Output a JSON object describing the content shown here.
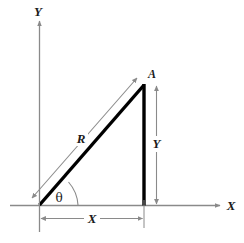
{
  "figure": {
    "kind": "vector-resolution-diagram",
    "background_color": "#ffffff",
    "width": 244,
    "height": 243,
    "axis_color": "#8a8a8a",
    "vector_color": "#000000",
    "dimension_color": "#8a8a8a",
    "label_color": "#1a1a1a"
  },
  "axes": {
    "y_axis_label": "Y",
    "x_axis_label": "X",
    "origin": {
      "x": 39,
      "y": 205
    }
  },
  "vector": {
    "tip_label": "A",
    "magnitude_label": "R",
    "angle_label": "θ",
    "tip_point": {
      "x": 144,
      "y": 85
    }
  },
  "components": {
    "horizontal_label": "X",
    "vertical_label": "Y"
  }
}
